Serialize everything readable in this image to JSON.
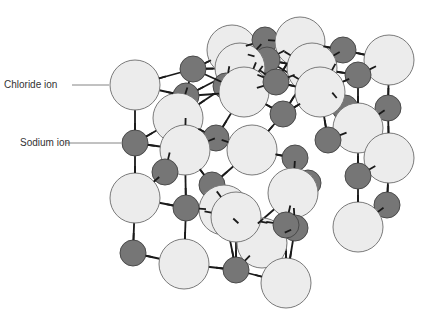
{
  "diagram": {
    "type": "crystal-lattice",
    "labels": [
      {
        "text": "Chloride ion",
        "x": 4,
        "y": 79,
        "line_to": [
          109,
          85
        ]
      },
      {
        "text": "Sodium ion",
        "x": 20,
        "y": 137,
        "line_to": [
          121,
          143
        ]
      }
    ],
    "colors": {
      "chloride_fill": "#ececec",
      "chloride_stroke": "#7a7a7a",
      "sodium_fill": "#767676",
      "sodium_stroke": "#4a4a4a",
      "bond": "#1a1a1a",
      "label_line": "#666666"
    },
    "ions": [
      {
        "kind": "Cl",
        "x": 232,
        "y": 50,
        "r": 25
      },
      {
        "kind": "Na",
        "x": 265,
        "y": 40,
        "r": 13
      },
      {
        "kind": "Cl",
        "x": 300,
        "y": 42,
        "r": 25
      },
      {
        "kind": "Na",
        "x": 343,
        "y": 50,
        "r": 13
      },
      {
        "kind": "Cl",
        "x": 389,
        "y": 60,
        "r": 25
      },
      {
        "kind": "Na",
        "x": 267,
        "y": 60,
        "r": 13
      },
      {
        "kind": "Na",
        "x": 358,
        "y": 75,
        "r": 13
      },
      {
        "kind": "Cl",
        "x": 240,
        "y": 68,
        "r": 25
      },
      {
        "kind": "Cl",
        "x": 312,
        "y": 68,
        "r": 25
      },
      {
        "kind": "Na",
        "x": 193,
        "y": 69,
        "r": 13
      },
      {
        "kind": "Na",
        "x": 226,
        "y": 86,
        "r": 13
      },
      {
        "kind": "Na",
        "x": 345,
        "y": 108,
        "r": 13
      },
      {
        "kind": "Na",
        "x": 388,
        "y": 108,
        "r": 13
      },
      {
        "kind": "Cl",
        "x": 135,
        "y": 85,
        "r": 25
      },
      {
        "kind": "Na",
        "x": 186,
        "y": 96,
        "r": 13
      },
      {
        "kind": "Cl",
        "x": 244,
        "y": 92,
        "r": 25
      },
      {
        "kind": "Na",
        "x": 276,
        "y": 82,
        "r": 13
      },
      {
        "kind": "Cl",
        "x": 320,
        "y": 92,
        "r": 25
      },
      {
        "kind": "Cl",
        "x": 178,
        "y": 118,
        "r": 25
      },
      {
        "kind": "Na",
        "x": 216,
        "y": 138,
        "r": 13
      },
      {
        "kind": "Cl",
        "x": 358,
        "y": 128,
        "r": 25
      },
      {
        "kind": "Na",
        "x": 283,
        "y": 114,
        "r": 13
      },
      {
        "kind": "Na",
        "x": 328,
        "y": 140,
        "r": 13
      },
      {
        "kind": "Cl",
        "x": 389,
        "y": 158,
        "r": 25
      },
      {
        "kind": "Cl",
        "x": 185,
        "y": 150,
        "r": 25
      },
      {
        "kind": "Na",
        "x": 135,
        "y": 143,
        "r": 13
      },
      {
        "kind": "Cl",
        "x": 252,
        "y": 150,
        "r": 25
      },
      {
        "kind": "Na",
        "x": 295,
        "y": 158,
        "r": 13
      },
      {
        "kind": "Na",
        "x": 308,
        "y": 183,
        "r": 13
      },
      {
        "kind": "Cl",
        "x": 293,
        "y": 193,
        "r": 25
      },
      {
        "kind": "Na",
        "x": 165,
        "y": 172,
        "r": 13
      },
      {
        "kind": "Na",
        "x": 212,
        "y": 185,
        "r": 13
      },
      {
        "kind": "Na",
        "x": 358,
        "y": 176,
        "r": 13
      },
      {
        "kind": "Cl",
        "x": 224,
        "y": 210,
        "r": 25
      },
      {
        "kind": "Cl",
        "x": 135,
        "y": 198,
        "r": 25
      },
      {
        "kind": "Na",
        "x": 186,
        "y": 208,
        "r": 13
      },
      {
        "kind": "Na",
        "x": 248,
        "y": 232,
        "r": 13
      },
      {
        "kind": "Na",
        "x": 295,
        "y": 228,
        "r": 13
      },
      {
        "kind": "Cl",
        "x": 262,
        "y": 243,
        "r": 25
      },
      {
        "kind": "Na",
        "x": 387,
        "y": 205,
        "r": 13
      },
      {
        "kind": "Cl",
        "x": 236,
        "y": 217,
        "r": 25
      },
      {
        "kind": "Cl",
        "x": 358,
        "y": 227,
        "r": 25
      },
      {
        "kind": "Na",
        "x": 286,
        "y": 225,
        "r": 13
      },
      {
        "kind": "Cl",
        "x": 184,
        "y": 264,
        "r": 25
      },
      {
        "kind": "Na",
        "x": 133,
        "y": 253,
        "r": 13
      },
      {
        "kind": "Na",
        "x": 236,
        "y": 270,
        "r": 13
      },
      {
        "kind": "Cl",
        "x": 286,
        "y": 283,
        "r": 25
      }
    ]
  }
}
